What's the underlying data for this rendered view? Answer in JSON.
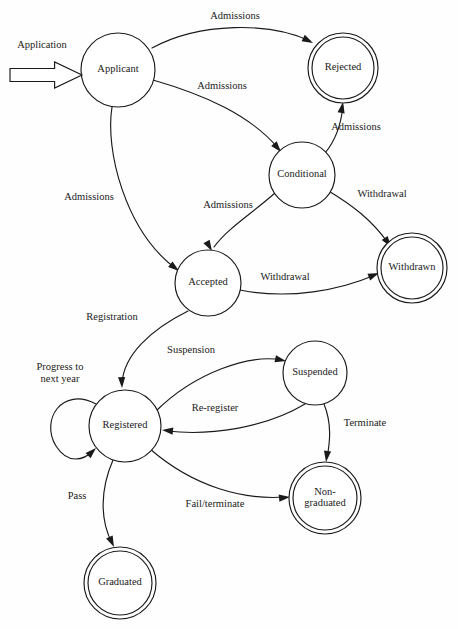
{
  "diagram": {
    "colors": {
      "stroke": "#1a1a1a",
      "fill": "#ffffff",
      "background": "#fefefe"
    },
    "start": {
      "label": "Application",
      "label_x": 42,
      "label_y": 46,
      "arrow_x": 10,
      "arrow_y": 62,
      "arrow_width": 72,
      "arrow_height": 26
    },
    "states": [
      {
        "id": "applicant",
        "label": "Applicant",
        "cx": 118,
        "cy": 70,
        "r": 37,
        "final": false,
        "lines": [
          "Applicant"
        ]
      },
      {
        "id": "rejected",
        "label": "Rejected",
        "cx": 343,
        "cy": 68,
        "r": 35,
        "final": true,
        "lines": [
          "Rejected"
        ]
      },
      {
        "id": "conditional",
        "label": "Conditional",
        "cx": 302,
        "cy": 175,
        "r": 33,
        "final": false,
        "lines": [
          "Conditional"
        ]
      },
      {
        "id": "withdrawn",
        "label": "Withdrawn",
        "cx": 412,
        "cy": 268,
        "r": 35,
        "final": true,
        "lines": [
          "Withdrawn"
        ]
      },
      {
        "id": "accepted",
        "label": "Accepted",
        "cx": 208,
        "cy": 283,
        "r": 33,
        "final": false,
        "lines": [
          "Accepted"
        ]
      },
      {
        "id": "registered",
        "label": "Registered",
        "cx": 125,
        "cy": 426,
        "r": 36,
        "final": false,
        "lines": [
          "Registered"
        ]
      },
      {
        "id": "suspended",
        "label": "Suspended",
        "cx": 315,
        "cy": 373,
        "r": 32,
        "final": false,
        "lines": [
          "Suspended"
        ]
      },
      {
        "id": "nongraduated",
        "label": "Non-graduated",
        "cx": 325,
        "cy": 498,
        "r": 36,
        "final": true,
        "lines": [
          "Non-",
          "graduated"
        ]
      },
      {
        "id": "graduated",
        "label": "Graduated",
        "cx": 120,
        "cy": 583,
        "r": 36,
        "final": true,
        "lines": [
          "Graduated"
        ]
      }
    ],
    "transitions": [
      {
        "id": "t1",
        "from": "applicant",
        "to": "rejected",
        "label": "Admissions",
        "label_x": 235,
        "label_y": 17,
        "path": "M 152,48 C 200,22 270,22 310,41",
        "head_x": 313,
        "head_y": 43,
        "head_angle": 27
      },
      {
        "id": "t2",
        "from": "applicant",
        "to": "conditional",
        "label": "Admissions",
        "label_x": 222,
        "label_y": 87,
        "path": "M 153,80 C 205,95 250,115 278,148",
        "head_x": 281,
        "head_y": 152,
        "head_angle": 50
      },
      {
        "id": "t3",
        "from": "conditional",
        "to": "rejected",
        "label": "Admissions",
        "label_x": 356,
        "label_y": 128,
        "path": "M 325,153 C 336,140 341,125 343,106",
        "head_x": 343,
        "head_y": 102,
        "head_angle": -80
      },
      {
        "id": "t4",
        "from": "applicant",
        "to": "accepted",
        "label": "Admissions",
        "label_x": 89,
        "label_y": 198,
        "path": "M 112,107 C 105,150 125,230 175,268",
        "head_x": 179,
        "head_y": 271,
        "head_angle": 38
      },
      {
        "id": "t5",
        "from": "conditional",
        "to": "accepted",
        "label": "Admissions",
        "label_x": 228,
        "label_y": 206,
        "path": "M 275,193 C 250,215 228,228 214,247",
        "head_x": 212,
        "head_y": 251,
        "head_angle": 60
      },
      {
        "id": "t6",
        "from": "conditional",
        "to": "withdrawn",
        "label": "Withdrawal",
        "label_x": 382,
        "label_y": 195,
        "path": "M 327,190 C 352,205 372,220 388,243",
        "head_x": 391,
        "head_y": 247,
        "head_angle": 55
      },
      {
        "id": "t7",
        "from": "accepted",
        "to": "withdrawn",
        "label": "Withdrawal",
        "label_x": 285,
        "label_y": 278,
        "path": "M 240,290 C 290,300 340,290 375,275",
        "head_x": 379,
        "head_y": 273,
        "head_angle": -22
      },
      {
        "id": "t8",
        "from": "accepted",
        "to": "registered",
        "label": "Registration",
        "label_x": 112,
        "label_y": 318,
        "path": "M 188,311 C 150,330 124,355 122,383",
        "head_x": 122,
        "head_y": 388,
        "head_angle": 88
      },
      {
        "id": "t9",
        "from": "registered",
        "to": "suspended",
        "label": "Suspension",
        "label_x": 191,
        "label_y": 351,
        "path": "M 155,412 C 195,372 250,354 282,360",
        "head_x": 286,
        "head_y": 361,
        "head_angle": 12
      },
      {
        "id": "t10",
        "from": "suspended",
        "to": "registered",
        "label": "Re-register",
        "label_x": 215,
        "label_y": 409,
        "path": "M 305,404 C 265,428 210,436 167,431",
        "head_x": 162,
        "head_y": 430,
        "head_angle": 186
      },
      {
        "id": "t11",
        "from": "suspended",
        "to": "nongraduated",
        "label": "Terminate",
        "label_x": 365,
        "label_y": 424,
        "path": "M 324,404 C 332,424 330,442 327,458",
        "head_x": 326,
        "head_y": 462,
        "head_angle": 98
      },
      {
        "id": "t12",
        "from": "registered",
        "to": "nongraduated",
        "label": "Fail/terminate",
        "label_x": 215,
        "label_y": 505,
        "path": "M 150,449 C 195,488 245,500 285,497",
        "head_x": 290,
        "head_y": 497,
        "head_angle": -6
      },
      {
        "id": "t13",
        "from": "registered",
        "to": "graduated",
        "label": "Pass",
        "label_x": 77,
        "label_y": 497,
        "path": "M 113,460 C 100,490 100,520 112,543",
        "head_x": 114,
        "head_y": 547,
        "head_angle": 65
      },
      {
        "id": "t14",
        "from": "registered",
        "to": "registered",
        "label": "Progress to next year",
        "label_x": 60,
        "label_y": 373,
        "label_lines": [
          "Progress to",
          "next year"
        ],
        "path": "M 96,404 C 62,386 40,420 56,446 C 68,465 84,460 93,451",
        "head_x": 96,
        "head_y": 448,
        "head_angle": -44,
        "self_loop": true
      }
    ]
  }
}
